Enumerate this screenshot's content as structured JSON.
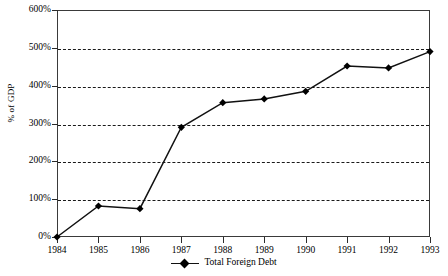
{
  "chart_data": {
    "type": "line",
    "title": "",
    "xlabel": "",
    "ylabel": "% of GDP",
    "categories": [
      "1984",
      "1985",
      "1986",
      "1987",
      "1988",
      "1989",
      "1990",
      "1991",
      "1992",
      "1993"
    ],
    "x": [
      1984,
      1985,
      1986,
      1987,
      1988,
      1989,
      1990,
      1991,
      1992,
      1993
    ],
    "series": [
      {
        "name": "Total Foreign Debt",
        "values": [
          0,
          82,
          75,
          290,
          355,
          365,
          385,
          452,
          447,
          490
        ],
        "marker": "diamond",
        "color": "#000000"
      }
    ],
    "ylim": [
      0,
      600
    ],
    "yticks": [
      0,
      100,
      200,
      300,
      400,
      500,
      600
    ],
    "ytick_labels": [
      "0%",
      "100%",
      "200%",
      "300%",
      "400%",
      "500%",
      "600%"
    ],
    "xtick_labels": [
      "1984",
      "1985",
      "1986",
      "1987",
      "1988",
      "1989",
      "1990",
      "1991",
      "1992",
      "1993"
    ],
    "grid": "horizontal-dashed",
    "legend_position": "bottom-center",
    "legend_entries": [
      "Total Foreign Debt"
    ]
  },
  "axes": {
    "y_title": "% of GDP"
  },
  "legend": {
    "entry_label": "Total Foreign Debt"
  }
}
